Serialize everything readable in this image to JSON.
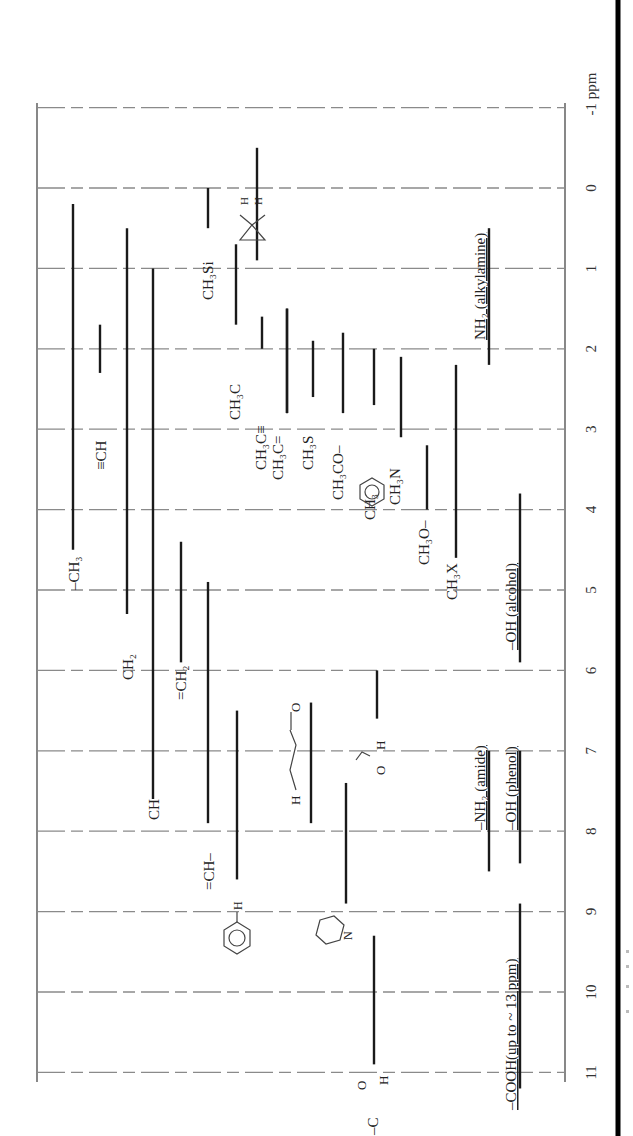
{
  "chart_data": {
    "type": "range-bar",
    "orientation": "rotated 90deg clockwise (ppm axis runs top-to-bottom on right side)",
    "axis": {
      "unit_label": "ppm",
      "ticks": [
        -1,
        0,
        1,
        2,
        3,
        4,
        5,
        6,
        7,
        8,
        9,
        10,
        11
      ],
      "tick_labels": [
        "-1 ppm",
        "0",
        "1",
        "2",
        "3",
        "4",
        "5",
        "6",
        "7",
        "8",
        "9",
        "10",
        "11"
      ],
      "range": [
        -1,
        11
      ],
      "grid": true
    },
    "series": [
      {
        "name": "-CH3",
        "x": 73,
        "from": 0.2,
        "to": 4.5,
        "label_ppm": 5.0
      },
      {
        "name": "≡CH",
        "x": 100,
        "from": 1.7,
        "to": 2.3,
        "label_ppm": 3.5
      },
      {
        "name": "CH2 (methylene)",
        "x": 127,
        "from": 0.5,
        "to": 5.3,
        "label_ppm": 5.9
      },
      {
        "name": "CH (methine)",
        "x": 153,
        "from": 1.0,
        "to": 7.6,
        "label_ppm": 7.6
      },
      {
        "name": "=CH2",
        "x": 181,
        "from": 4.4,
        "to": 5.9,
        "label_ppm": 6.2
      },
      {
        "name": "=CH-",
        "x": 208,
        "from": 4.9,
        "to": 7.9,
        "label_ppm": 8.2
      },
      {
        "name": "aromatic H (benzene)",
        "x": 237,
        "from": 6.5,
        "to": 8.6,
        "label_ppm": 9.4
      },
      {
        "name": "CH3Si",
        "x": 208,
        "from": 0.0,
        "to": 0.5,
        "label_ppm": 1.0
      },
      {
        "name": "cyclopropane H",
        "x": 257,
        "from": -0.5,
        "to": 0.9,
        "label_ppm": 0.0
      },
      {
        "name": "CH3Si (lower)",
        "x": 236,
        "from": 0.7,
        "to": 1.7,
        "label_ppm": 1.0
      },
      {
        "name": "CH3C(sp3)",
        "x": 262,
        "from": 1.6,
        "to": 2.0,
        "label_ppm": 2.5
      },
      {
        "name": "CH3C≡",
        "x": 287,
        "from": 1.5,
        "to": 2.8,
        "label_ppm": 3.0
      },
      {
        "name": "CH3C=",
        "x": 287,
        "from": 1.5,
        "to": 2.8,
        "label_ppm": 3.2
      },
      {
        "name": "CH3S",
        "x": 313,
        "from": 1.9,
        "to": 2.6,
        "label_ppm": 3.2
      },
      {
        "name": "CH3CO-",
        "x": 343,
        "from": 1.8,
        "to": 2.8,
        "label_ppm": 3.6
      },
      {
        "name": "CH3-Ar (toluene)",
        "x": 374,
        "from": 2.0,
        "to": 2.7,
        "label_ppm": 3.7
      },
      {
        "name": "CH3N",
        "x": 401,
        "from": 2.1,
        "to": 3.1,
        "label_ppm": 3.5
      },
      {
        "name": "CH3O-",
        "x": 427,
        "from": 3.2,
        "to": 4.0,
        "label_ppm": 4.6
      },
      {
        "name": "CH3X",
        "x": 456,
        "from": 2.2,
        "to": 4.6,
        "label_ppm": 4.9
      },
      {
        "name": "-OH (alcohol)",
        "x": 520,
        "from": 3.8,
        "to": 5.9,
        "label_ppm": 4.9,
        "underlined": true
      },
      {
        "name": "NH2 (alkylamine)",
        "x": 489,
        "from": 0.5,
        "to": 2.2,
        "label_ppm": 1.0,
        "underlined": true
      },
      {
        "name": "cis-enal H",
        "x": 311,
        "from": 6.4,
        "to": 7.9,
        "label_ppm": 7.2
      },
      {
        "name": "formamide H (HCON)",
        "x": 377,
        "from": 6.0,
        "to": 6.6,
        "label_ppm": 7.0
      },
      {
        "name": "-NH2 (amide)",
        "x": 489,
        "from": 7.0,
        "to": 8.5,
        "label_ppm": 7.9,
        "underlined": true
      },
      {
        "name": "-OH (phenol)",
        "x": 520,
        "from": 7.0,
        "to": 8.4,
        "label_ppm": 7.9,
        "underlined": true
      },
      {
        "name": "pyridine H",
        "x": 346,
        "from": 7.4,
        "to": 8.9,
        "label_ppm": 9.3
      },
      {
        "name": "-CHO (aldehyde)",
        "x": 374,
        "from": 9.3,
        "to": 10.9,
        "label_ppm": 11.2
      },
      {
        "name": "-COOH (up to ~13 ppm)",
        "x": 520,
        "from": 8.9,
        "to": 11.2,
        "label_ppm": 9.8,
        "underlined": true
      }
    ],
    "labels": {
      "ch3": "–CH₃",
      "ech": "≡CH",
      "ch2": "CH₂",
      "ch": "CH",
      "eqch2": "=CH₂",
      "eqch": "=CH–",
      "ch3si": "CH₃Si",
      "ch3c": "CH₃C",
      "ch3ctriple": "CH₃C≡",
      "ch3cdouble": "CH₃C=",
      "ch3s": "CH₃S",
      "ch3co": "CH₃CO–",
      "ch3ar": "CH₃",
      "ch3n": "CH₃N",
      "ch3o": "CH₃O–",
      "ch3x": "CH₃X",
      "oh_alcohol": "–OH (alcohol)",
      "nh2_alkyl": "NH₂ (alkylamine)",
      "nh2_amide": "–NH₂ (amide)",
      "oh_phenol": "–OH (phenol)",
      "cooh": "–COOH(up to ~ 13 ppm)",
      "cho": "–C(=O)H",
      "cyclo_h": "H H",
      "formyl": "O H",
      "enal": "H   O",
      "py_n": "N",
      "benz_h": "H"
    }
  }
}
